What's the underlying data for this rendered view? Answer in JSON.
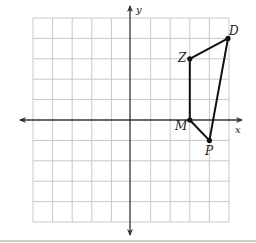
{
  "diagram": {
    "type": "coordinate-plane",
    "grid": {
      "x_range": [
        -5,
        5
      ],
      "y_range": [
        -5,
        5
      ],
      "step": 1
    },
    "axes": {
      "x_label": "x",
      "y_label": "y"
    },
    "polygon": {
      "name": "ZDPM",
      "vertices": [
        {
          "label": "Z",
          "x": 3,
          "y": 3
        },
        {
          "label": "D",
          "x": 5,
          "y": 4
        },
        {
          "label": "P",
          "x": 4,
          "y": -1
        },
        {
          "label": "M",
          "x": 3,
          "y": 0
        }
      ]
    },
    "colors": {
      "grid": "#c8c8c8",
      "axes": "#333333",
      "polygon": "#111111",
      "divider": "#999999"
    }
  }
}
